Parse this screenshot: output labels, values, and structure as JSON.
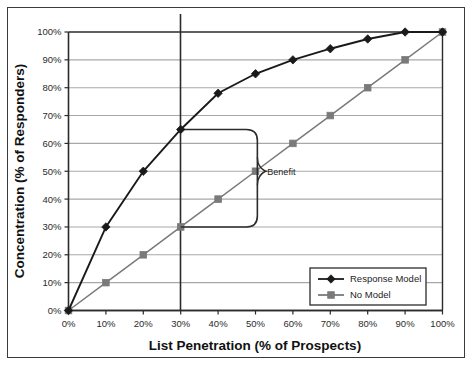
{
  "chart_data": {
    "type": "line",
    "title": "",
    "xlabel": "List Penetration (% of Prospects)",
    "ylabel": "Concentration (% of Responders)",
    "xlim": [
      0,
      100
    ],
    "ylim": [
      0,
      100
    ],
    "grid": "horizontal",
    "legend_position": "bottom-right",
    "x": [
      0,
      10,
      20,
      30,
      40,
      50,
      60,
      70,
      80,
      90,
      100
    ],
    "xtick_labels": [
      "0%",
      "10%",
      "20%",
      "30%",
      "40%",
      "50%",
      "60%",
      "70%",
      "80%",
      "90%",
      "100%"
    ],
    "ytick_labels": [
      "0%",
      "10%",
      "20%",
      "30%",
      "40%",
      "50%",
      "60%",
      "70%",
      "80%",
      "90%",
      "100%"
    ],
    "series": [
      {
        "name": "Response Model",
        "marker": "diamond",
        "color": "#1a1a1a",
        "values": [
          0,
          30,
          50,
          65,
          78,
          85,
          90,
          94,
          97.5,
          100,
          100
        ]
      },
      {
        "name": "No Model",
        "marker": "square",
        "color": "#7a7a7a",
        "values": [
          0,
          10,
          20,
          30,
          40,
          50,
          60,
          70,
          80,
          90,
          100
        ]
      }
    ],
    "annotations": [
      {
        "label": "Benefit",
        "type": "bracket",
        "at_x": 30,
        "y_top": 65,
        "y_bottom": 30,
        "pointer_y": 50
      },
      {
        "label": "",
        "type": "vertical-reference-line",
        "at_x": 30
      }
    ]
  },
  "colors": {
    "response_model": "#1a1a1a",
    "no_model": "#7a7a7a",
    "gridline": "#a8a8a8",
    "axis": "#2b2b2b",
    "frame": "#3a3a3a",
    "background": "#ffffff"
  },
  "axes": {
    "x_title": "List Penetration (% of Prospects)",
    "y_title": "Concentration (% of Responders)",
    "x_ticks": [
      "0%",
      "10%",
      "20%",
      "30%",
      "40%",
      "50%",
      "60%",
      "70%",
      "80%",
      "90%",
      "100%"
    ],
    "y_ticks": [
      "100%",
      "90%",
      "80%",
      "70%",
      "60%",
      "50%",
      "40%",
      "30%",
      "20%",
      "10%",
      "0%"
    ]
  },
  "legend": {
    "items": [
      {
        "label": "Response Model",
        "marker": "diamond"
      },
      {
        "label": "No Model",
        "marker": "square"
      }
    ]
  },
  "annotation": {
    "benefit_label": "Benefit"
  }
}
